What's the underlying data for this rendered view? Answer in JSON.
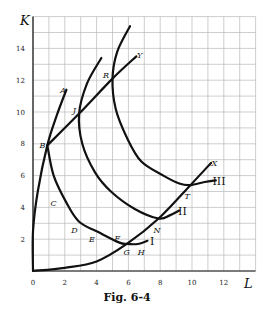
{
  "caption": "Fig. 6-4",
  "chart_data": {
    "type": "line",
    "title": "Fig. 6-4",
    "xlabel": "L",
    "ylabel": "K",
    "xlim": [
      0,
      14
    ],
    "ylim": [
      0,
      16
    ],
    "grid": true,
    "x_ticks": [
      0,
      2,
      4,
      6,
      8,
      10,
      12
    ],
    "y_ticks": [
      2,
      4,
      6,
      8,
      10,
      12,
      14
    ],
    "x_tick_labels": [
      "0",
      "2",
      "4",
      "6",
      "8",
      "10",
      "12"
    ],
    "y_tick_labels": [
      "2",
      "4",
      "6",
      "8",
      "10",
      "12",
      "14"
    ],
    "series": [
      {
        "name": "I",
        "kind": "isoquant",
        "points": [
          [
            0.9,
            7.9
          ],
          [
            1.3,
            6.0
          ],
          [
            2.1,
            4.3
          ],
          [
            2.9,
            3.1
          ],
          [
            4.2,
            2.4
          ],
          [
            5.4,
            1.8
          ],
          [
            5.9,
            1.7
          ],
          [
            6.6,
            1.7
          ],
          [
            7.2,
            1.9
          ]
        ]
      },
      {
        "name": "II",
        "kind": "isoquant",
        "points": [
          [
            4.3,
            13.4
          ],
          [
            3.4,
            11.8
          ],
          [
            2.9,
            9.9
          ],
          [
            3.1,
            8.0
          ],
          [
            3.9,
            6.2
          ],
          [
            4.9,
            5.0
          ],
          [
            6.4,
            3.9
          ],
          [
            7.9,
            3.3
          ],
          [
            8.6,
            3.5
          ],
          [
            9.2,
            3.8
          ]
        ]
      },
      {
        "name": "III",
        "kind": "isoquant",
        "points": [
          [
            6.1,
            15.4
          ],
          [
            5.3,
            13.8
          ],
          [
            5.0,
            12.1
          ],
          [
            5.2,
            10.2
          ],
          [
            5.9,
            8.4
          ],
          [
            6.8,
            6.9
          ],
          [
            8.2,
            6.0
          ],
          [
            9.2,
            5.5
          ],
          [
            9.9,
            5.4
          ],
          [
            10.8,
            5.6
          ],
          [
            11.5,
            5.7
          ]
        ]
      },
      {
        "name": "0X",
        "kind": "expansion-path",
        "points": [
          [
            0,
            0
          ],
          [
            2,
            0.2
          ],
          [
            4,
            0.6
          ],
          [
            5.9,
            1.7
          ],
          [
            7.9,
            3.3
          ],
          [
            9.9,
            5.4
          ],
          [
            11.2,
            6.8
          ]
        ]
      },
      {
        "name": "0Y",
        "kind": "ridge-line",
        "points": [
          [
            0,
            0
          ],
          [
            0,
            2.5
          ],
          [
            0.3,
            5.0
          ],
          [
            0.9,
            7.9
          ],
          [
            1.5,
            9.8
          ],
          [
            2.1,
            11.4
          ]
        ]
      },
      {
        "name": "BY",
        "kind": "ridge-line",
        "points": [
          [
            0.9,
            7.9
          ],
          [
            2.9,
            9.9
          ],
          [
            5.0,
            12.1
          ],
          [
            6.5,
            13.5
          ]
        ]
      }
    ],
    "annotations": [
      {
        "label": "A",
        "x": 1.9,
        "y": 11.4
      },
      {
        "label": "B",
        "x": 0.6,
        "y": 7.9
      },
      {
        "label": "J",
        "x": 2.6,
        "y": 10.1
      },
      {
        "label": "R",
        "x": 4.6,
        "y": 12.3
      },
      {
        "label": "Y",
        "x": 6.7,
        "y": 13.6
      },
      {
        "label": "C",
        "x": 1.3,
        "y": 4.3
      },
      {
        "label": "D",
        "x": 2.6,
        "y": 2.6
      },
      {
        "label": "E",
        "x": 3.7,
        "y": 2.0
      },
      {
        "label": "F",
        "x": 5.3,
        "y": 2.1
      },
      {
        "label": "G",
        "x": 5.9,
        "y": 1.2
      },
      {
        "label": "H",
        "x": 6.8,
        "y": 1.2
      },
      {
        "label": "N",
        "x": 7.8,
        "y": 2.6
      },
      {
        "label": "T",
        "x": 9.7,
        "y": 4.7
      },
      {
        "label": "X",
        "x": 11.4,
        "y": 6.8
      },
      {
        "label": "I",
        "x": 7.5,
        "y": 1.8
      },
      {
        "label": "II",
        "x": 9.4,
        "y": 3.7
      },
      {
        "label": "III",
        "x": 11.7,
        "y": 5.6
      }
    ]
  }
}
